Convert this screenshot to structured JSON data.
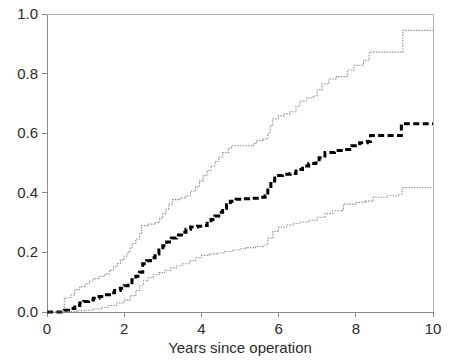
{
  "chart_data": {
    "type": "line",
    "title": "",
    "subtitle": "",
    "xlabel": "Years since operation",
    "ylabel": "",
    "xlim": [
      0,
      10
    ],
    "ylim": [
      0,
      1
    ],
    "xticks": [
      0,
      2,
      4,
      6,
      8,
      10
    ],
    "xtick_labels": [
      "0",
      "2",
      "4",
      "6",
      "8",
      "10"
    ],
    "yticks": [
      0.0,
      0.2,
      0.4,
      0.6,
      0.8,
      1.0
    ],
    "ytick_labels": [
      "0.0",
      "0.2",
      "0.4",
      "0.6",
      "0.8",
      "1.0"
    ],
    "grid": false,
    "legend": "none",
    "interpolation": "step-post",
    "annotations": [],
    "series": [
      {
        "name": "Upper 95% confidence limit",
        "style": "dotted-thin",
        "color": "#8c8c8c",
        "points": [
          [
            0.0,
            0.0
          ],
          [
            0.45,
            0.0
          ],
          [
            0.45,
            0.048
          ],
          [
            0.62,
            0.057
          ],
          [
            0.72,
            0.075
          ],
          [
            0.85,
            0.085
          ],
          [
            1.0,
            0.095
          ],
          [
            1.1,
            0.103
          ],
          [
            1.2,
            0.112
          ],
          [
            1.35,
            0.12
          ],
          [
            1.5,
            0.128
          ],
          [
            1.62,
            0.14
          ],
          [
            1.72,
            0.152
          ],
          [
            1.82,
            0.163
          ],
          [
            1.9,
            0.175
          ],
          [
            2.0,
            0.188
          ],
          [
            2.08,
            0.2
          ],
          [
            2.15,
            0.215
          ],
          [
            2.2,
            0.23
          ],
          [
            2.3,
            0.245
          ],
          [
            2.4,
            0.262
          ],
          [
            2.45,
            0.29
          ],
          [
            2.62,
            0.295
          ],
          [
            2.8,
            0.3
          ],
          [
            2.92,
            0.315
          ],
          [
            3.0,
            0.33
          ],
          [
            3.08,
            0.345
          ],
          [
            3.15,
            0.362
          ],
          [
            3.25,
            0.377
          ],
          [
            3.45,
            0.383
          ],
          [
            3.6,
            0.39
          ],
          [
            3.72,
            0.405
          ],
          [
            3.85,
            0.42
          ],
          [
            3.95,
            0.44
          ],
          [
            4.05,
            0.458
          ],
          [
            4.15,
            0.475
          ],
          [
            4.25,
            0.49
          ],
          [
            4.35,
            0.505
          ],
          [
            4.45,
            0.52
          ],
          [
            4.55,
            0.535
          ],
          [
            4.7,
            0.55
          ],
          [
            4.78,
            0.558
          ],
          [
            5.0,
            0.558
          ],
          [
            5.2,
            0.558
          ],
          [
            5.35,
            0.565
          ],
          [
            5.42,
            0.575
          ],
          [
            5.6,
            0.58
          ],
          [
            5.72,
            0.6
          ],
          [
            5.78,
            0.625
          ],
          [
            5.85,
            0.648
          ],
          [
            6.0,
            0.658
          ],
          [
            6.15,
            0.665
          ],
          [
            6.3,
            0.672
          ],
          [
            6.45,
            0.69
          ],
          [
            6.55,
            0.708
          ],
          [
            6.72,
            0.718
          ],
          [
            6.9,
            0.725
          ],
          [
            7.0,
            0.745
          ],
          [
            7.12,
            0.765
          ],
          [
            7.3,
            0.782
          ],
          [
            7.5,
            0.79
          ],
          [
            7.62,
            0.79
          ],
          [
            7.78,
            0.812
          ],
          [
            7.95,
            0.828
          ],
          [
            8.2,
            0.845
          ],
          [
            8.35,
            0.872
          ],
          [
            8.6,
            0.872
          ],
          [
            8.9,
            0.872
          ],
          [
            9.15,
            0.872
          ],
          [
            9.22,
            0.945
          ],
          [
            9.6,
            0.945
          ],
          [
            10.0,
            0.945
          ]
        ]
      },
      {
        "name": "Cumulative incidence estimate",
        "style": "dashed-thick",
        "color": "#000000",
        "points": [
          [
            0.0,
            0.0
          ],
          [
            0.45,
            0.0
          ],
          [
            0.45,
            0.006
          ],
          [
            0.6,
            0.012
          ],
          [
            0.72,
            0.022
          ],
          [
            0.85,
            0.03
          ],
          [
            0.95,
            0.035
          ],
          [
            1.08,
            0.04
          ],
          [
            1.2,
            0.046
          ],
          [
            1.35,
            0.052
          ],
          [
            1.5,
            0.058
          ],
          [
            1.62,
            0.065
          ],
          [
            1.75,
            0.072
          ],
          [
            1.9,
            0.08
          ],
          [
            2.0,
            0.088
          ],
          [
            2.1,
            0.098
          ],
          [
            2.2,
            0.108
          ],
          [
            2.3,
            0.12
          ],
          [
            2.4,
            0.133
          ],
          [
            2.48,
            0.162
          ],
          [
            2.58,
            0.172
          ],
          [
            2.68,
            0.182
          ],
          [
            2.8,
            0.195
          ],
          [
            2.9,
            0.208
          ],
          [
            3.0,
            0.222
          ],
          [
            3.1,
            0.235
          ],
          [
            3.22,
            0.248
          ],
          [
            3.35,
            0.258
          ],
          [
            3.48,
            0.268
          ],
          [
            3.6,
            0.278
          ],
          [
            3.72,
            0.285
          ],
          [
            3.9,
            0.288
          ],
          [
            4.05,
            0.29
          ],
          [
            4.15,
            0.298
          ],
          [
            4.25,
            0.31
          ],
          [
            4.35,
            0.322
          ],
          [
            4.45,
            0.335
          ],
          [
            4.55,
            0.348
          ],
          [
            4.65,
            0.36
          ],
          [
            4.75,
            0.372
          ],
          [
            4.9,
            0.378
          ],
          [
            5.1,
            0.38
          ],
          [
            5.3,
            0.382
          ],
          [
            5.5,
            0.385
          ],
          [
            5.65,
            0.39
          ],
          [
            5.72,
            0.415
          ],
          [
            5.8,
            0.44
          ],
          [
            5.9,
            0.458
          ],
          [
            6.1,
            0.462
          ],
          [
            6.3,
            0.465
          ],
          [
            6.45,
            0.478
          ],
          [
            6.62,
            0.49
          ],
          [
            6.78,
            0.498
          ],
          [
            6.95,
            0.5
          ],
          [
            7.05,
            0.518
          ],
          [
            7.2,
            0.535
          ],
          [
            7.45,
            0.542
          ],
          [
            7.7,
            0.545
          ],
          [
            7.9,
            0.558
          ],
          [
            8.1,
            0.568
          ],
          [
            8.3,
            0.572
          ],
          [
            8.38,
            0.592
          ],
          [
            8.7,
            0.592
          ],
          [
            9.0,
            0.592
          ],
          [
            9.18,
            0.632
          ],
          [
            9.5,
            0.632
          ],
          [
            10.0,
            0.632
          ]
        ]
      },
      {
        "name": "Lower 95% confidence limit",
        "style": "dotted-thin",
        "color": "#8c8c8c",
        "points": [
          [
            0.0,
            0.0
          ],
          [
            0.45,
            0.0
          ],
          [
            0.55,
            0.002
          ],
          [
            0.8,
            0.004
          ],
          [
            1.0,
            0.006
          ],
          [
            1.2,
            0.01
          ],
          [
            1.4,
            0.016
          ],
          [
            1.6,
            0.022
          ],
          [
            1.8,
            0.03
          ],
          [
            2.0,
            0.04
          ],
          [
            2.15,
            0.055
          ],
          [
            2.3,
            0.072
          ],
          [
            2.4,
            0.09
          ],
          [
            2.5,
            0.105
          ],
          [
            2.62,
            0.115
          ],
          [
            2.75,
            0.125
          ],
          [
            2.9,
            0.132
          ],
          [
            3.05,
            0.14
          ],
          [
            3.2,
            0.148
          ],
          [
            3.35,
            0.155
          ],
          [
            3.5,
            0.162
          ],
          [
            3.7,
            0.172
          ],
          [
            3.85,
            0.182
          ],
          [
            4.0,
            0.19
          ],
          [
            4.2,
            0.195
          ],
          [
            4.4,
            0.198
          ],
          [
            4.6,
            0.202
          ],
          [
            4.8,
            0.208
          ],
          [
            5.0,
            0.212
          ],
          [
            5.15,
            0.216
          ],
          [
            5.4,
            0.22
          ],
          [
            5.6,
            0.225
          ],
          [
            5.72,
            0.248
          ],
          [
            5.85,
            0.27
          ],
          [
            6.0,
            0.285
          ],
          [
            6.2,
            0.292
          ],
          [
            6.4,
            0.298
          ],
          [
            6.55,
            0.302
          ],
          [
            6.8,
            0.308
          ],
          [
            7.0,
            0.318
          ],
          [
            7.2,
            0.33
          ],
          [
            7.4,
            0.34
          ],
          [
            7.62,
            0.342
          ],
          [
            7.68,
            0.362
          ],
          [
            8.0,
            0.368
          ],
          [
            8.25,
            0.372
          ],
          [
            8.45,
            0.385
          ],
          [
            8.8,
            0.39
          ],
          [
            9.1,
            0.395
          ],
          [
            9.2,
            0.418
          ],
          [
            9.6,
            0.418
          ],
          [
            10.0,
            0.418
          ]
        ]
      }
    ]
  },
  "plot_geometry": {
    "left_px": 47,
    "right_px": 433,
    "top_px": 14,
    "bottom_px": 312,
    "tick_len_px": 5
  },
  "axes": {
    "x_axis_name": "x-axis",
    "y_axis_name": "y-axis"
  }
}
